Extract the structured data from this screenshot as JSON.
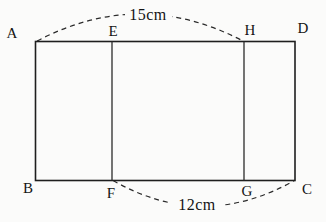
{
  "figure": {
    "vertex_labels": {
      "A": "A",
      "B": "B",
      "C": "C",
      "D": "D",
      "E": "E",
      "F": "F",
      "G": "G",
      "H": "H"
    },
    "measurements": {
      "top": "15cm",
      "bottom": "12cm"
    }
  }
}
